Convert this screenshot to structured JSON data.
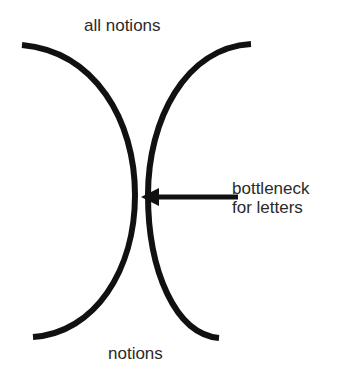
{
  "diagram": {
    "top_label": "all notions",
    "bottom_label": "notions",
    "annotation": {
      "line1": "bottleneck",
      "line2": "for letters"
    },
    "stroke_color": "#111111",
    "background": "#ffffff"
  }
}
